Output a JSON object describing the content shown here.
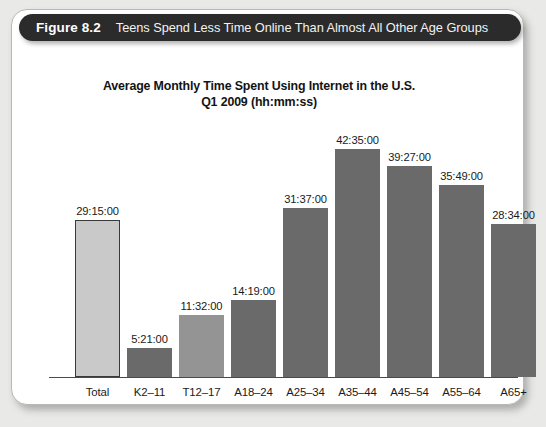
{
  "figure": {
    "number": "Figure 8.2",
    "caption": "Teens Spend Less Time Online Than Almost All Other Age Groups"
  },
  "chart_data": {
    "type": "bar",
    "title": "Average Monthly Time Spent Using Internet in the U.S.",
    "subtitle": "Q1 2009 (hh:mm:ss)",
    "xlabel": "",
    "ylabel": "",
    "grid": false,
    "legend": "none",
    "axis_visible": {
      "x": true,
      "y": false
    },
    "value_format": "hh:mm:ss",
    "ylim_hours": [
      0,
      45
    ],
    "categories": [
      "Total",
      "K2–11",
      "T12–17",
      "A18–24",
      "A25–34",
      "A35–44",
      "A45–54",
      "A55–64",
      "A65+"
    ],
    "labels": [
      "29:15:00",
      "5:21:00",
      "11:32:00",
      "14:19:00",
      "31:37:00",
      "42:35:00",
      "39:27:00",
      "35:49:00",
      "28:34:00"
    ],
    "values_hours": [
      29.25,
      5.35,
      11.533,
      14.317,
      31.617,
      42.583,
      39.45,
      35.817,
      28.567
    ],
    "bar_colors": [
      "#c9c9c9",
      "#6a6a6a",
      "#949494",
      "#6a6a6a",
      "#6a6a6a",
      "#6a6a6a",
      "#6a6a6a",
      "#6a6a6a",
      "#6a6a6a"
    ],
    "bar_border_colors": [
      "#3a3a3a",
      "none",
      "none",
      "none",
      "none",
      "none",
      "none",
      "none",
      "none"
    ],
    "bars": [
      {
        "category": "Total",
        "label": "29:15:00",
        "hours": 29.25,
        "color": "#c9c9c9",
        "border": "#3a3a3a"
      },
      {
        "category": "K2–11",
        "label": "5:21:00",
        "hours": 5.35,
        "color": "#6a6a6a",
        "border": "none"
      },
      {
        "category": "T12–17",
        "label": "11:32:00",
        "hours": 11.533,
        "color": "#949494",
        "border": "none"
      },
      {
        "category": "A18–24",
        "label": "14:19:00",
        "hours": 14.317,
        "color": "#6a6a6a",
        "border": "none"
      },
      {
        "category": "A25–34",
        "label": "31:37:00",
        "hours": 31.617,
        "color": "#6a6a6a",
        "border": "none"
      },
      {
        "category": "A35–44",
        "label": "42:35:00",
        "hours": 42.583,
        "color": "#6a6a6a",
        "border": "none"
      },
      {
        "category": "A45–54",
        "label": "39:27:00",
        "hours": 39.45,
        "color": "#6a6a6a",
        "border": "none"
      },
      {
        "category": "A55–64",
        "label": "35:49:00",
        "hours": 35.817,
        "color": "#6a6a6a",
        "border": "none"
      },
      {
        "category": "A65+",
        "label": "28:34:00",
        "hours": 28.567,
        "color": "#6a6a6a",
        "border": "none"
      }
    ]
  },
  "style": {
    "header_bg": "#2b2b2b",
    "header_text": "#ffffff",
    "card_bg": "#ffffff",
    "page_bg": "#e9e9e7",
    "axis_color": "#4a4a4a",
    "text_color": "#1a1a1a"
  }
}
